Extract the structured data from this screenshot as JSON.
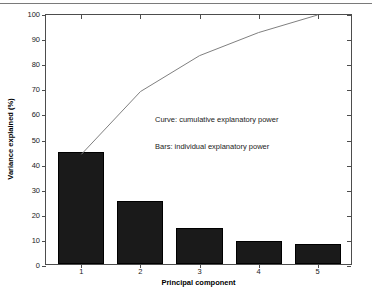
{
  "chart_data": {
    "type": "bar",
    "title": "",
    "subtitle": "",
    "xlabel": "Principal component",
    "ylabel": "Variance explained (%)",
    "categories": [
      "1",
      "2",
      "3",
      "4",
      "5"
    ],
    "xtick_labels": [
      "1",
      "2",
      "3",
      "4",
      "5"
    ],
    "ytick_labels": [
      "0",
      "10",
      "20",
      "30",
      "40",
      "50",
      "60",
      "70",
      "80",
      "90",
      "100"
    ],
    "ytick_values": [
      0,
      10,
      20,
      30,
      40,
      50,
      60,
      70,
      80,
      90,
      100
    ],
    "ylim": [
      0,
      100
    ],
    "xlim": [
      0.4,
      5.6
    ],
    "grid": false,
    "legend": false,
    "legend_position": "none",
    "series": [
      {
        "name": "Bars: individual explanatory power",
        "type": "bar",
        "values": [
          44.5,
          25.0,
          14.3,
          9.2,
          8.0
        ],
        "color": "#1a1a1a"
      },
      {
        "name": "Curve: cumulative explanatory power",
        "type": "line",
        "values": [
          44.5,
          69.5,
          83.8,
          93.0,
          100.0
        ],
        "color": "#808080"
      }
    ],
    "annotations": [
      "Curve: cumulative explanatory power",
      "Bars: individual explanatory power"
    ]
  },
  "axes": {
    "x_title": "Principal component",
    "y_title": "Variance explained (%)"
  },
  "annotations": {
    "curve_note": "Curve: cumulative explanatory power",
    "bars_note": "Bars: individual explanatory power"
  },
  "colors": {
    "bar_fill": "#1a1a1a",
    "curve_line": "#808080",
    "axis": "#4d4d4d",
    "background": "#ffffff",
    "rule": "#7a7a7a"
  }
}
